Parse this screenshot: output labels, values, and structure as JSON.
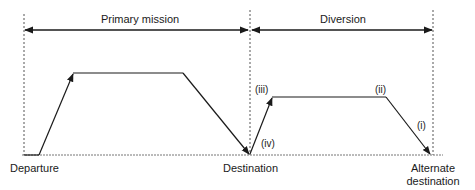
{
  "diagram": {
    "type": "mission-profile",
    "colors": {
      "line": "#1a1a1a",
      "guide": "#555555",
      "background": "#ffffff"
    },
    "phases": [
      {
        "label": "Primary mission",
        "from": "Departure",
        "to": "Destination"
      },
      {
        "label": "Diversion",
        "from": "Destination",
        "to": "Alternate destination"
      }
    ],
    "locations": {
      "departure": "Departure",
      "destination": "Destination",
      "alternate_line1": "Alternate",
      "alternate_line2": "destination"
    },
    "segment_markers": {
      "i": "(i)",
      "ii": "(ii)",
      "iii": "(iii)",
      "iv": "(iv)"
    },
    "profile_points": [
      {
        "x": 24,
        "y": 155
      },
      {
        "x": 39,
        "y": 155
      },
      {
        "x": 73,
        "y": 73
      },
      {
        "x": 183,
        "y": 73
      },
      {
        "x": 249,
        "y": 154
      },
      {
        "x": 272,
        "y": 97
      },
      {
        "x": 386,
        "y": 97
      },
      {
        "x": 430,
        "y": 154
      }
    ]
  }
}
